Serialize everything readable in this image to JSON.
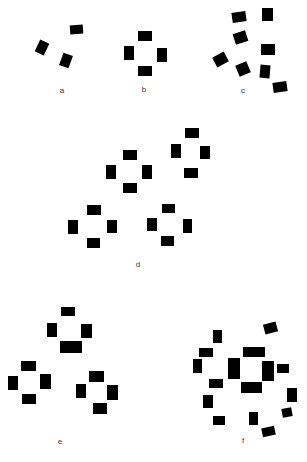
{
  "figure": {
    "background_color": "#ffffff",
    "rect_color": "#000000",
    "label_color": "#3c3c3c"
  },
  "panels": [
    {
      "id": "a",
      "label": "a",
      "label_pos": {
        "x": 62,
        "y": 87
      },
      "rects": [
        {
          "x": 70,
          "y": 25,
          "w": 13,
          "h": 9,
          "r": -4
        },
        {
          "x": 37,
          "y": 41,
          "w": 10,
          "h": 13,
          "r": 25
        },
        {
          "x": 61,
          "y": 54,
          "w": 10,
          "h": 13,
          "r": 20
        }
      ]
    },
    {
      "id": "b",
      "label": "b",
      "label_pos": {
        "x": 144,
        "y": 86
      },
      "rects": [
        {
          "x": 138,
          "y": 31,
          "w": 14,
          "h": 10,
          "r": 0
        },
        {
          "x": 124,
          "y": 46,
          "w": 10,
          "h": 14,
          "r": 0
        },
        {
          "x": 157,
          "y": 48,
          "w": 10,
          "h": 14,
          "r": 0
        },
        {
          "x": 138,
          "y": 66,
          "w": 14,
          "h": 10,
          "r": 0
        }
      ]
    },
    {
      "id": "c",
      "label": "c",
      "label_pos": {
        "x": 243,
        "y": 87
      },
      "rects": [
        {
          "x": 232,
          "y": 12,
          "w": 14,
          "h": 10,
          "r": -8
        },
        {
          "x": 262,
          "y": 8,
          "w": 11,
          "h": 13,
          "r": 0
        },
        {
          "x": 234,
          "y": 32,
          "w": 13,
          "h": 11,
          "r": -18
        },
        {
          "x": 261,
          "y": 44,
          "w": 14,
          "h": 11,
          "r": 0
        },
        {
          "x": 214,
          "y": 54,
          "w": 13,
          "h": 11,
          "r": -28
        },
        {
          "x": 237,
          "y": 63,
          "w": 12,
          "h": 12,
          "r": -22
        },
        {
          "x": 260,
          "y": 65,
          "w": 10,
          "h": 13,
          "r": 5
        },
        {
          "x": 273,
          "y": 82,
          "w": 14,
          "h": 10,
          "r": -8
        }
      ]
    },
    {
      "id": "d",
      "label": "d",
      "label_pos": {
        "x": 138,
        "y": 261
      },
      "rects": [
        {
          "x": 123,
          "y": 150,
          "w": 14,
          "h": 10,
          "r": 0
        },
        {
          "x": 106,
          "y": 165,
          "w": 10,
          "h": 14,
          "r": 0
        },
        {
          "x": 142,
          "y": 165,
          "w": 10,
          "h": 14,
          "r": 0
        },
        {
          "x": 123,
          "y": 183,
          "w": 14,
          "h": 10,
          "r": 0
        },
        {
          "x": 185,
          "y": 128,
          "w": 14,
          "h": 10,
          "r": 0
        },
        {
          "x": 171,
          "y": 144,
          "w": 10,
          "h": 14,
          "r": 0
        },
        {
          "x": 200,
          "y": 146,
          "w": 10,
          "h": 13,
          "r": 0
        },
        {
          "x": 184,
          "y": 168,
          "w": 14,
          "h": 10,
          "r": 0
        },
        {
          "x": 87,
          "y": 205,
          "w": 14,
          "h": 10,
          "r": 0
        },
        {
          "x": 68,
          "y": 220,
          "w": 10,
          "h": 14,
          "r": 0
        },
        {
          "x": 107,
          "y": 220,
          "w": 10,
          "h": 13,
          "r": 0
        },
        {
          "x": 87,
          "y": 238,
          "w": 13,
          "h": 10,
          "r": 0
        },
        {
          "x": 162,
          "y": 204,
          "w": 13,
          "h": 9,
          "r": 0
        },
        {
          "x": 147,
          "y": 218,
          "w": 10,
          "h": 13,
          "r": 0
        },
        {
          "x": 183,
          "y": 219,
          "w": 9,
          "h": 14,
          "r": 0
        },
        {
          "x": 161,
          "y": 236,
          "w": 13,
          "h": 10,
          "r": 0
        }
      ]
    },
    {
      "id": "e",
      "label": "e",
      "label_pos": {
        "x": 60,
        "y": 438
      },
      "rects": [
        {
          "x": 61,
          "y": 307,
          "w": 14,
          "h": 9,
          "r": 0
        },
        {
          "x": 47,
          "y": 323,
          "w": 10,
          "h": 14,
          "r": 0
        },
        {
          "x": 81,
          "y": 324,
          "w": 11,
          "h": 14,
          "r": 0
        },
        {
          "x": 60,
          "y": 341,
          "w": 22,
          "h": 12,
          "r": 0
        },
        {
          "x": 21,
          "y": 361,
          "w": 15,
          "h": 10,
          "r": 0
        },
        {
          "x": 8,
          "y": 376,
          "w": 10,
          "h": 14,
          "r": 0
        },
        {
          "x": 40,
          "y": 374,
          "w": 11,
          "h": 15,
          "r": 0
        },
        {
          "x": 22,
          "y": 394,
          "w": 14,
          "h": 10,
          "r": 0
        },
        {
          "x": 89,
          "y": 371,
          "w": 15,
          "h": 11,
          "r": 0
        },
        {
          "x": 76,
          "y": 384,
          "w": 10,
          "h": 14,
          "r": 0
        },
        {
          "x": 107,
          "y": 385,
          "w": 11,
          "h": 15,
          "r": 0
        },
        {
          "x": 93,
          "y": 403,
          "w": 14,
          "h": 11,
          "r": 0
        }
      ]
    },
    {
      "id": "f",
      "label": "f",
      "label_pos": {
        "x": 243,
        "y": 437
      },
      "rects": [
        {
          "x": 243,
          "y": 347,
          "w": 22,
          "h": 10,
          "r": 0
        },
        {
          "x": 228,
          "y": 358,
          "w": 12,
          "h": 21,
          "r": 0
        },
        {
          "x": 262,
          "y": 361,
          "w": 12,
          "h": 20,
          "r": 0
        },
        {
          "x": 241,
          "y": 382,
          "w": 21,
          "h": 11,
          "r": 0
        },
        {
          "x": 264,
          "y": 323,
          "w": 13,
          "h": 10,
          "r": -15
        },
        {
          "x": 213,
          "y": 330,
          "w": 9,
          "h": 13,
          "r": 0
        },
        {
          "x": 199,
          "y": 348,
          "w": 14,
          "h": 9,
          "r": 0
        },
        {
          "x": 193,
          "y": 359,
          "w": 9,
          "h": 14,
          "r": 0
        },
        {
          "x": 277,
          "y": 364,
          "w": 12,
          "h": 9,
          "r": 0
        },
        {
          "x": 209,
          "y": 379,
          "w": 14,
          "h": 9,
          "r": 0
        },
        {
          "x": 203,
          "y": 395,
          "w": 10,
          "h": 13,
          "r": 0
        },
        {
          "x": 287,
          "y": 388,
          "w": 10,
          "h": 14,
          "r": 0
        },
        {
          "x": 282,
          "y": 408,
          "w": 10,
          "h": 9,
          "r": -10
        },
        {
          "x": 249,
          "y": 412,
          "w": 9,
          "h": 13,
          "r": 0
        },
        {
          "x": 262,
          "y": 427,
          "w": 13,
          "h": 9,
          "r": -12
        },
        {
          "x": 213,
          "y": 416,
          "w": 12,
          "h": 9,
          "r": 0
        }
      ]
    }
  ]
}
